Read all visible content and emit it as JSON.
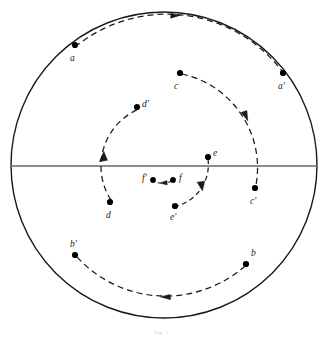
{
  "figure": {
    "caption": "Fig. 1",
    "colors": {
      "stroke": "#1a1a1a",
      "diameter_line": "#666666",
      "background": "#ffffff",
      "point_fill": "#000000"
    },
    "disk": {
      "cx": 164,
      "cy": 165,
      "r": 153,
      "stroke_width": 1.4
    },
    "diameter": {
      "y": 166,
      "x1": 11,
      "x2": 317,
      "stroke_width": 1.6
    },
    "points": [
      {
        "id": "a",
        "label": "a",
        "x": 75,
        "y": 45,
        "lx": 70,
        "ly": 54
      },
      {
        "id": "ap",
        "label": "a'",
        "x": 283,
        "y": 73,
        "lx": 278,
        "ly": 82
      },
      {
        "id": "b",
        "label": "b",
        "x": 246,
        "y": 264,
        "lx": 251,
        "ly": 249
      },
      {
        "id": "bp",
        "label": "b'",
        "x": 75,
        "y": 255,
        "lx": 70,
        "ly": 240
      },
      {
        "id": "c",
        "label": "c",
        "x": 180,
        "y": 73,
        "lx": 174,
        "ly": 82
      },
      {
        "id": "cp",
        "label": "c'",
        "x": 255,
        "y": 188,
        "lx": 250,
        "ly": 197
      },
      {
        "id": "d",
        "label": "d",
        "x": 110,
        "y": 202,
        "lx": 106,
        "ly": 211
      },
      {
        "id": "dp",
        "label": "d'",
        "x": 137,
        "y": 107,
        "lx": 142,
        "ly": 104
      },
      {
        "id": "e",
        "label": "e",
        "x": 208,
        "y": 157,
        "lx": 213,
        "ly": 153
      },
      {
        "id": "ep",
        "label": "e'",
        "x": 175,
        "y": 206,
        "lx": 170,
        "ly": 215
      },
      {
        "id": "f",
        "label": "f",
        "x": 173,
        "y": 180,
        "lx": 179,
        "ly": 178
      },
      {
        "id": "fp",
        "label": "f'",
        "x": 153,
        "y": 180,
        "lx": 143,
        "ly": 178
      }
    ],
    "arcs": [
      {
        "id": "arc-a-ap",
        "from": "a",
        "to": "ap",
        "radius": 145,
        "direction": "clockwise",
        "label": "outermost orbit a to a-prime"
      },
      {
        "id": "arc-b-bp",
        "from": "b",
        "to": "bp",
        "radius": 120,
        "direction": "clockwise",
        "label": "lower orbit b to b-prime"
      },
      {
        "id": "arc-c-cp",
        "from": "c",
        "to": "cp",
        "radius": 96,
        "direction": "clockwise",
        "label": "orbit c to c-prime"
      },
      {
        "id": "arc-d-dp",
        "from": "d",
        "to": "dp",
        "radius": 62,
        "direction": "counterclockwise",
        "label": "orbit d to d-prime"
      },
      {
        "id": "arc-e-ep",
        "from": "e",
        "to": "ep",
        "radius": 43,
        "direction": "clockwise",
        "label": "inner orbit e to e-prime"
      },
      {
        "id": "arc-f-fp",
        "from": "f",
        "to": "fp",
        "radius": 14,
        "direction": "clockwise",
        "label": "innermost orbit f to f-prime"
      }
    ],
    "arrowheads": [
      {
        "id": "arrow-top",
        "x": 178,
        "y": 15,
        "angle": -10,
        "on_arc": "arc-a-ap"
      },
      {
        "id": "arrow-bottom",
        "x": 163,
        "y": 297,
        "angle": 172,
        "on_arc": "arc-b-bp"
      },
      {
        "id": "arrow-c",
        "x": 246,
        "y": 118,
        "angle": 58,
        "on_arc": "arc-c-cp"
      },
      {
        "id": "arrow-d",
        "x": 103,
        "y": 155,
        "angle": -78,
        "on_arc": "arc-d-dp"
      },
      {
        "id": "arrow-e",
        "x": 201,
        "y": 189,
        "angle": 112,
        "on_arc": "arc-e-ep"
      },
      {
        "id": "arrow-f",
        "x": 161,
        "y": 183,
        "angle": 188,
        "on_arc": "arc-f-fp"
      }
    ]
  }
}
